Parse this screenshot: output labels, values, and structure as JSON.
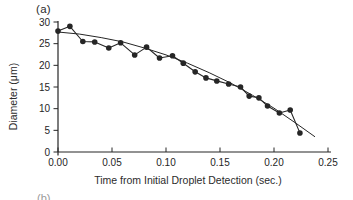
{
  "chart_data": {
    "type": "scatter",
    "panel_label": "(a)",
    "next_panel_label": "(b)",
    "title": "",
    "xlabel": "Time from Initial Droplet Detection (sec.)",
    "ylabel": "Diameter (μm)",
    "xlim": [
      0,
      0.25
    ],
    "ylim": [
      0,
      30
    ],
    "x_ticks": [
      0.0,
      0.05,
      0.1,
      0.15,
      0.2,
      0.25
    ],
    "y_ticks": [
      0,
      5,
      10,
      15,
      20,
      25,
      30
    ],
    "grid": false,
    "legend": "none",
    "ink_color": "#262626",
    "series": [
      {
        "name": "measured-droplet-diameter",
        "marker": "filled-circle",
        "connected": true,
        "points": [
          [
            0.0,
            27.9
          ],
          [
            0.011,
            29.0
          ],
          [
            0.023,
            25.5
          ],
          [
            0.034,
            25.4
          ],
          [
            0.047,
            24.0
          ],
          [
            0.058,
            25.2
          ],
          [
            0.071,
            22.4
          ],
          [
            0.082,
            24.2
          ],
          [
            0.094,
            21.7
          ],
          [
            0.106,
            22.2
          ],
          [
            0.116,
            20.5
          ],
          [
            0.127,
            18.5
          ],
          [
            0.137,
            17.1
          ],
          [
            0.147,
            16.4
          ],
          [
            0.158,
            15.7
          ],
          [
            0.169,
            15.0
          ],
          [
            0.177,
            12.9
          ],
          [
            0.186,
            12.5
          ],
          [
            0.194,
            10.6
          ],
          [
            0.205,
            9.0
          ],
          [
            0.215,
            9.7
          ],
          [
            0.224,
            4.4
          ]
        ]
      },
      {
        "name": "trend-fit-line",
        "marker": "none",
        "connected": true,
        "points": [
          [
            0.0,
            27.7
          ],
          [
            0.02,
            27.2
          ],
          [
            0.04,
            26.4
          ],
          [
            0.06,
            25.4
          ],
          [
            0.08,
            24.0
          ],
          [
            0.1,
            22.4
          ],
          [
            0.12,
            20.5
          ],
          [
            0.14,
            18.3
          ],
          [
            0.16,
            15.9
          ],
          [
            0.18,
            13.1
          ],
          [
            0.2,
            10.1
          ],
          [
            0.22,
            6.7
          ],
          [
            0.238,
            3.5
          ]
        ]
      }
    ]
  }
}
